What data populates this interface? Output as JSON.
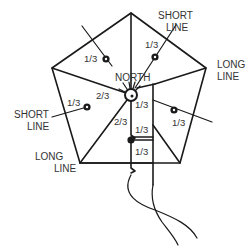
{
  "diagram": {
    "labels": {
      "north": "NORTH",
      "short_line_top": [
        "SHORT",
        "LINE"
      ],
      "long_line_right": [
        "LONG",
        "LINE"
      ],
      "short_line_left": [
        "SHORT",
        "LINE"
      ],
      "long_line_bottom_left": [
        "LONG",
        "LINE"
      ]
    },
    "fractions": {
      "upper_left_spar": "1/3",
      "upper_right_spar": "1/3",
      "left_spar_outer": "1/3",
      "left_spar_inner": "2/3",
      "right_spar_inner": "1/3",
      "right_spar_outer": "1/3",
      "center_box_top": "1/3",
      "center_left_2_3": "2/3",
      "center_box_middle": "1/3",
      "center_box_bottom": "1/3"
    },
    "colors": {
      "line": "#1a1a1a",
      "text": "#333333",
      "background": "#ffffff"
    }
  }
}
